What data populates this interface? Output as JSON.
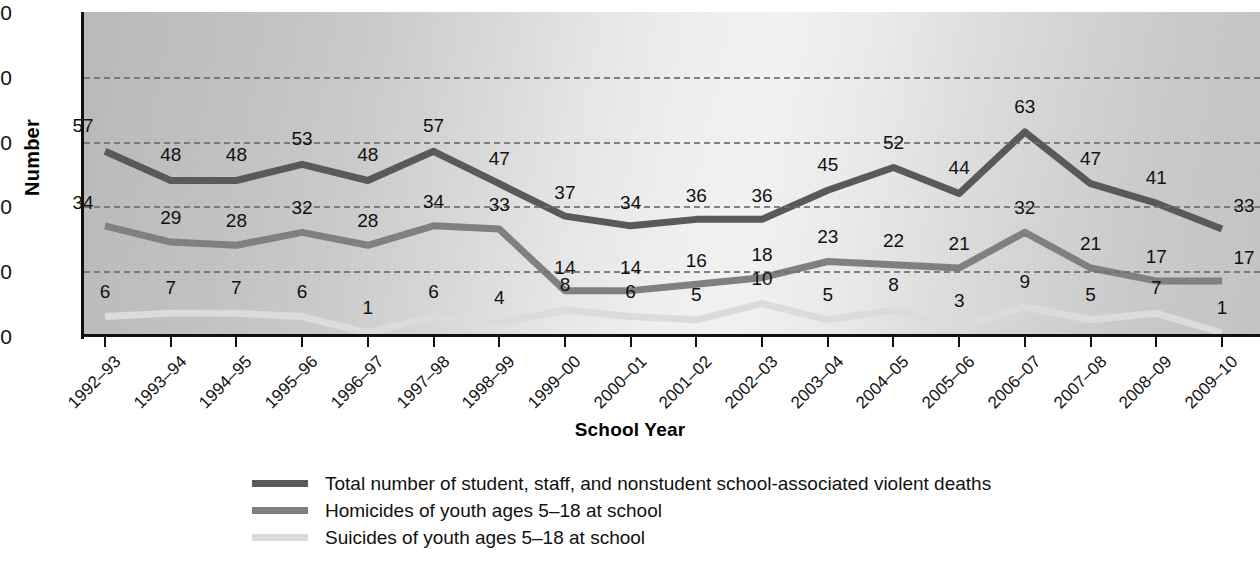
{
  "chart_data": {
    "type": "line",
    "title": "",
    "xlabel": "School Year",
    "ylabel": "Number",
    "ylim": [
      0,
      100
    ],
    "yticks": [
      0,
      20,
      40,
      60,
      80,
      100
    ],
    "grid": "horizontal-dashed",
    "legend_position": "bottom",
    "categories": [
      "1992–93",
      "1993–94",
      "1994–95",
      "1995–96",
      "1996–97",
      "1997–98",
      "1998–99",
      "1999–00",
      "2000–01",
      "2001–02",
      "2002–03",
      "2003–04",
      "2004–05",
      "2005–06",
      "2006–07",
      "2007–08",
      "2008–09",
      "2009–10"
    ],
    "series": [
      {
        "name": "Total number of student, staff, and nonstudent school-associated violent deaths",
        "color": "#595959",
        "values": [
          57,
          48,
          48,
          53,
          48,
          57,
          47,
          37,
          34,
          36,
          36,
          45,
          52,
          44,
          63,
          47,
          41,
          33
        ],
        "label_dy": [
          -26,
          -26,
          -26,
          -26,
          -26,
          -26,
          -26,
          -24,
          -24,
          -24,
          -24,
          -26,
          -26,
          -26,
          -26,
          -26,
          -26,
          -24
        ],
        "label_dx": [
          -22,
          0,
          0,
          0,
          0,
          0,
          0,
          0,
          0,
          0,
          0,
          0,
          0,
          0,
          0,
          0,
          0,
          22
        ]
      },
      {
        "name": "Homicides of youth ages 5–18 at school",
        "color": "#808080",
        "values": [
          34,
          29,
          28,
          32,
          28,
          34,
          33,
          14,
          14,
          16,
          18,
          23,
          22,
          21,
          32,
          21,
          17,
          17
        ],
        "label_dy": [
          -24,
          -25,
          -25,
          -25,
          -25,
          -25,
          -25,
          -24,
          -24,
          -24,
          -24,
          -25,
          -25,
          -25,
          -25,
          -25,
          -25,
          -24
        ],
        "label_dx": [
          -22,
          0,
          0,
          0,
          0,
          0,
          0,
          0,
          0,
          0,
          0,
          0,
          0,
          0,
          0,
          0,
          0,
          22
        ]
      },
      {
        "name": "Suicides of youth ages 5–18 at school",
        "color": "#dcdcdc",
        "values": [
          6,
          7,
          7,
          6,
          1,
          6,
          4,
          8,
          6,
          5,
          10,
          5,
          8,
          3,
          9,
          5,
          7,
          1
        ],
        "label_dy": [
          -26,
          -26,
          -26,
          -26,
          -26,
          -26,
          -26,
          -26,
          -26,
          -26,
          -26,
          -26,
          -26,
          -26,
          -26,
          -26,
          -26,
          -26
        ],
        "label_dx": [
          0,
          0,
          0,
          0,
          0,
          0,
          0,
          0,
          0,
          0,
          0,
          0,
          0,
          0,
          0,
          0,
          0,
          0
        ]
      }
    ]
  },
  "axes": {
    "y_title": "Number",
    "x_title": "School Year",
    "y_tick_labels": [
      "0",
      "20",
      "40",
      "60",
      "80",
      "100"
    ]
  },
  "legend": {
    "items": [
      {
        "label": "Total number of student, staff, and nonstudent school-associated violent deaths",
        "color": "#595959"
      },
      {
        "label": "Homicides of youth ages 5–18 at school",
        "color": "#808080"
      },
      {
        "label": "Suicides of youth ages 5–18 at school",
        "color": "#dcdcdc"
      }
    ]
  },
  "colors": {
    "total": "#595959",
    "homicides": "#808080",
    "suicides": "#dcdcdc",
    "axis": "#111111",
    "gridline": "#6e6e6e"
  }
}
